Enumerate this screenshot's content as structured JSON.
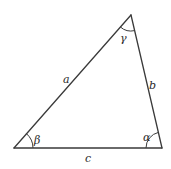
{
  "diagram": {
    "type": "triangle",
    "vertices": {
      "top": {
        "x": 131,
        "y": 15
      },
      "bottom_left": {
        "x": 14,
        "y": 148
      },
      "bottom_right": {
        "x": 162,
        "y": 148
      }
    },
    "sides": {
      "a": {
        "label": "a",
        "between": [
          "bottom_left",
          "top"
        ]
      },
      "b": {
        "label": "b",
        "between": [
          "top",
          "bottom_right"
        ]
      },
      "c": {
        "label": "c",
        "between": [
          "bottom_left",
          "bottom_right"
        ]
      }
    },
    "angles": {
      "alpha": {
        "label": "α",
        "vertex": "bottom_right"
      },
      "beta": {
        "label": "β",
        "vertex": "bottom_left"
      },
      "gamma": {
        "label": "γ",
        "vertex": "top"
      }
    },
    "colors": {
      "stroke": "#3a3a3a",
      "text": "#2a2a2a",
      "background": "#ffffff"
    }
  }
}
